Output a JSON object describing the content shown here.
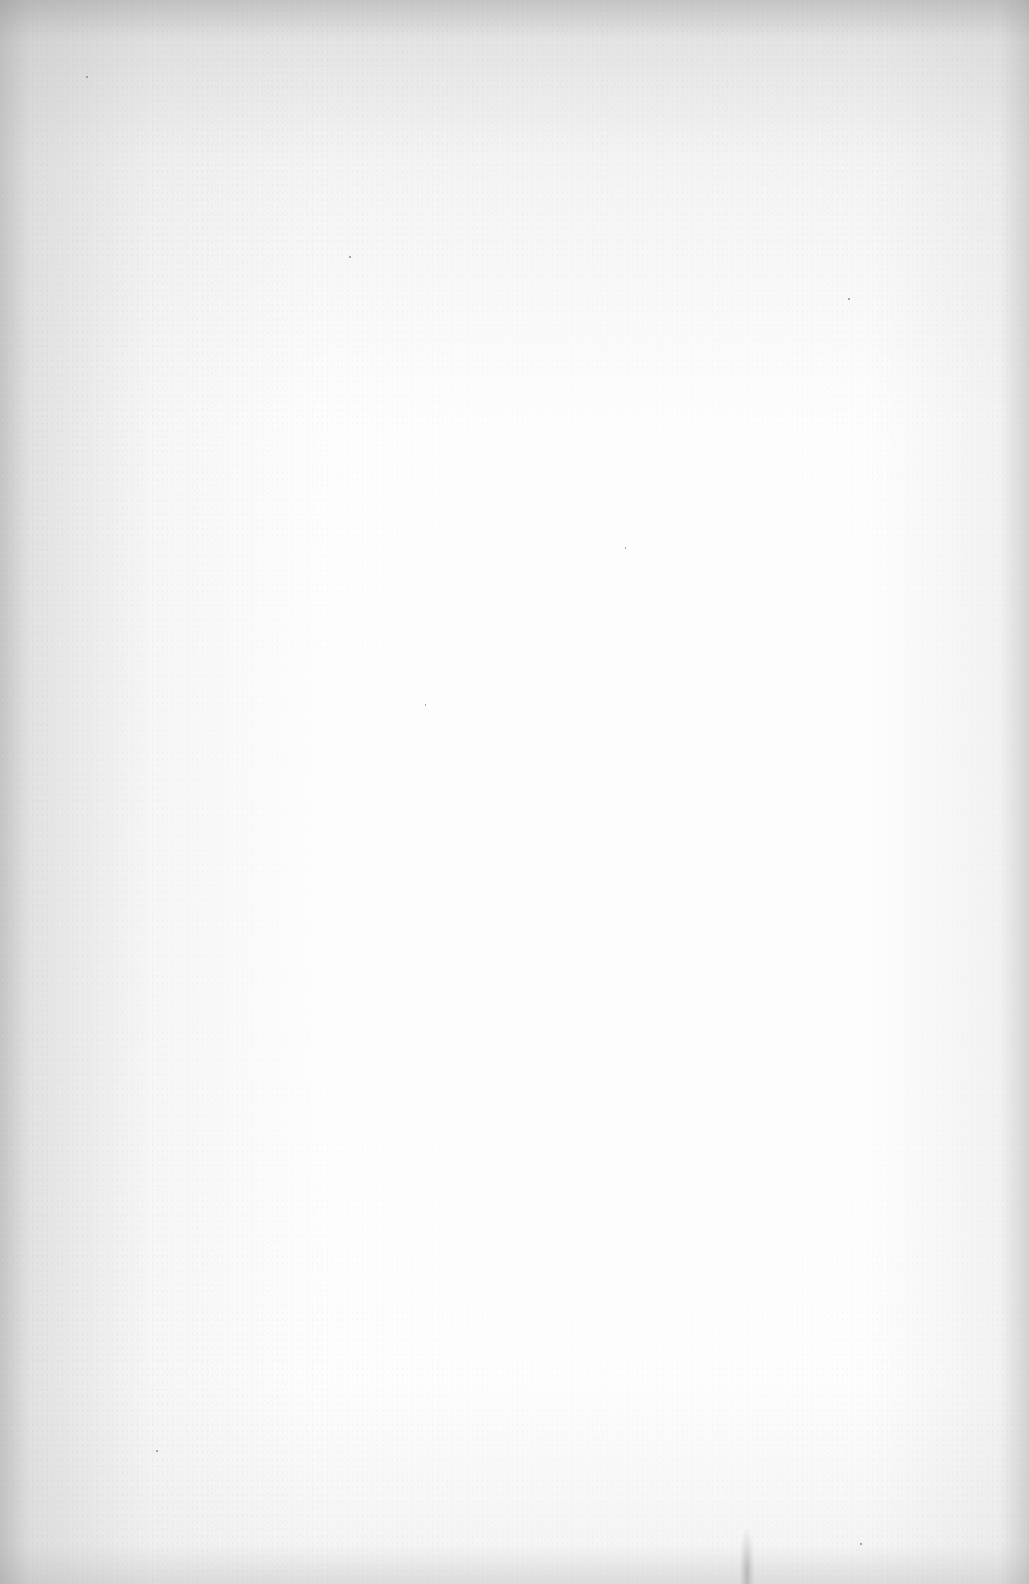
{
  "document": {
    "type": "scanned-page",
    "content": "",
    "colors": {
      "paper": "#fdfdfd",
      "edge_shadow": "#a0a0a0",
      "speck": "#8a8a8a"
    }
  }
}
